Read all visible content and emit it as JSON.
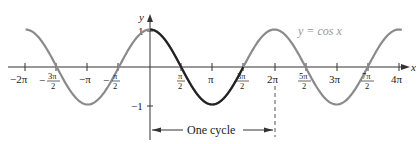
{
  "chart_data": {
    "type": "line",
    "title": "",
    "function": "y = cos x",
    "legend": [
      "y = cos x"
    ],
    "xlabel": "x",
    "ylabel": "y",
    "xlim": [
      -6.4,
      12.9
    ],
    "ylim": [
      -1.6,
      1.5
    ],
    "grid": false,
    "x_tick_labels": [
      "−2π",
      "−3π/2",
      "−π",
      "−π/2",
      "π/2",
      "π",
      "3π/2",
      "2π",
      "5π/2",
      "3π",
      "7π/2",
      "4π"
    ],
    "y_tick_labels": [
      "1",
      "−1"
    ],
    "series": [
      {
        "name": "y = cos x (one cycle, highlighted)",
        "x_range": [
          "0",
          "2π"
        ],
        "color": "#222222"
      },
      {
        "name": "y = cos x (rest)",
        "x_range": [
          "−2π",
          "4π"
        ],
        "color": "#8a8a8a"
      }
    ],
    "key_points": [
      {
        "x": "−2π",
        "y": 1
      },
      {
        "x": "−3π/2",
        "y": 0
      },
      {
        "x": "−π",
        "y": -1
      },
      {
        "x": "−π/2",
        "y": 0
      },
      {
        "x": "0",
        "y": 1
      },
      {
        "x": "π/2",
        "y": 0
      },
      {
        "x": "π",
        "y": -1
      },
      {
        "x": "3π/2",
        "y": 0
      },
      {
        "x": "2π",
        "y": 1
      },
      {
        "x": "5π/2",
        "y": 0
      },
      {
        "x": "3π",
        "y": -1
      },
      {
        "x": "7π/2",
        "y": 0
      },
      {
        "x": "4π",
        "y": 1
      }
    ],
    "annotations": [
      {
        "text": "One cycle",
        "from": "0",
        "to": "2π"
      }
    ]
  },
  "labels": {
    "x_axis": "x",
    "y_axis": "y",
    "y_one": "1",
    "y_neg_one": "−1",
    "legend": "y = cos x",
    "annotation": "One cycle",
    "ticks": {
      "neg2pi": "−2π",
      "negpi": "−π",
      "pi": "π",
      "twopi": "2π",
      "threepi": "3π",
      "fourpi": "4π",
      "neg3pi2_num": "3π",
      "neg3pi2_den": "2",
      "neg_sign": "−",
      "negpi2_num": "π",
      "negpi2_den": "2",
      "pi2_num": "π",
      "pi2_den": "2",
      "threepi2_num": "3π",
      "threepi2_den": "2",
      "fivepi2_num": "5π",
      "fivepi2_den": "2",
      "sevenpi2_num": "7π",
      "sevenpi2_den": "2"
    }
  },
  "colors": {
    "highlight": "#222222",
    "curve": "#8a8a8a",
    "axis": "#333333",
    "legend": "#999999"
  }
}
